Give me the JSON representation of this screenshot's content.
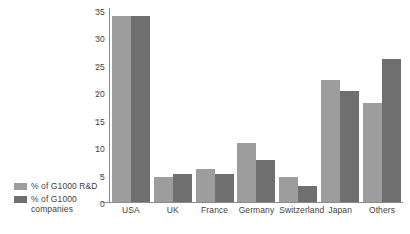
{
  "chart_data": {
    "type": "bar",
    "title": "",
    "subtitle": "",
    "xlabel": "",
    "ylabel": "",
    "ylim": [
      0,
      35
    ],
    "ytick_values": [
      0,
      5,
      10,
      15,
      20,
      25,
      30,
      35
    ],
    "ytick_labels": [
      "0",
      "5",
      "10",
      "15",
      "20",
      "25",
      "30",
      "35"
    ],
    "grid": false,
    "legend_position": "left",
    "categories": [
      "USA",
      "UK",
      "France",
      "Germany",
      "Switzerland",
      "Japan",
      "Others"
    ],
    "series": [
      {
        "name": "% of G1000 R&D",
        "color": "#9d9d9d",
        "values": [
          33.9,
          4.5,
          6.1,
          10.8,
          4.5,
          22.3,
          18.0
        ]
      },
      {
        "name": "% of G1000 companies",
        "color": "#6f6f6f",
        "values": [
          33.9,
          5.1,
          5.1,
          7.6,
          3.0,
          20.2,
          26.0
        ]
      }
    ]
  },
  "legend": {
    "items": [
      {
        "label": "% of G1000 R&D"
      },
      {
        "label": "% of G1000 companies"
      }
    ]
  },
  "colors": {
    "series_a": "#9d9d9d",
    "series_b": "#6f6f6f",
    "axis": "#8c8c8c",
    "text": "#3f3f3f",
    "background": "#ffffff"
  }
}
